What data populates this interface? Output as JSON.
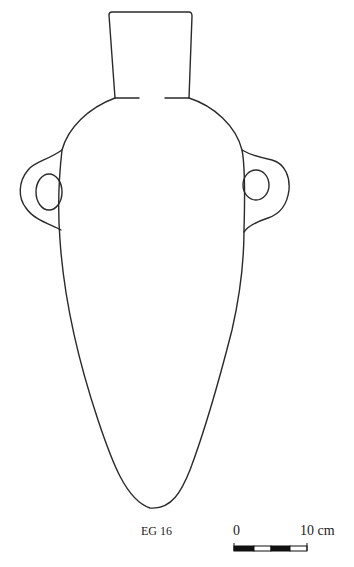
{
  "figure": {
    "catalog_label": "EG 16",
    "line_color": "#2a2a2a"
  },
  "scale_bar": {
    "start_label": "0",
    "end_label": "10 cm",
    "segments": 4,
    "segment_colors": [
      "#111111",
      "#ffffff",
      "#111111",
      "#ffffff"
    ]
  }
}
